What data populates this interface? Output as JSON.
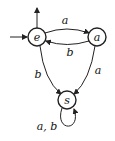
{
  "diagram": {
    "type": "finite-automaton",
    "states": [
      {
        "id": "e",
        "label": "e",
        "initial": true,
        "accepting": true
      },
      {
        "id": "a",
        "label": "a",
        "initial": false,
        "accepting": false
      },
      {
        "id": "s",
        "label": "s",
        "initial": false,
        "accepting": false
      }
    ],
    "transitions": [
      {
        "from": "e",
        "to": "a",
        "label": "a"
      },
      {
        "from": "a",
        "to": "e",
        "label": "b"
      },
      {
        "from": "e",
        "to": "s",
        "label": "b"
      },
      {
        "from": "a",
        "to": "s",
        "label": "a"
      },
      {
        "from": "s",
        "to": "s",
        "label": "a, b"
      }
    ],
    "labels": {
      "state_e": "e",
      "state_a": "a",
      "state_s": "s",
      "edge_e_a": "a",
      "edge_a_e": "b",
      "edge_e_s": "b",
      "edge_a_s": "a",
      "edge_s_s": "a, b"
    }
  }
}
